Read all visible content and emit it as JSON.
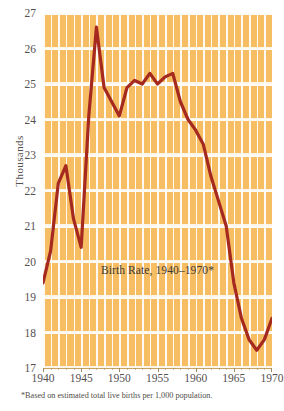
{
  "chart_data": {
    "type": "line",
    "title": "Birth Rate, 1940–1970*",
    "xlabel": "",
    "ylabel": "Thousands",
    "footnote": "*Based on estimated total live births per 1,000 population.",
    "xlim": [
      1940,
      1970
    ],
    "ylim": [
      17,
      27
    ],
    "grid": true,
    "legend": null,
    "x_ticks": [
      "1940",
      "1945",
      "1950",
      "1955",
      "1960",
      "1965",
      "1970"
    ],
    "y_ticks": [
      "17",
      "18",
      "19",
      "20",
      "21",
      "22",
      "23",
      "24",
      "25",
      "26",
      "27"
    ],
    "x": [
      1940,
      1941,
      1942,
      1943,
      1944,
      1945,
      1946,
      1947,
      1948,
      1949,
      1950,
      1951,
      1952,
      1953,
      1954,
      1955,
      1956,
      1957,
      1958,
      1959,
      1960,
      1961,
      1962,
      1963,
      1964,
      1965,
      1966,
      1967,
      1968,
      1969,
      1970
    ],
    "values": [
      19.4,
      20.3,
      22.2,
      22.7,
      21.2,
      20.4,
      24.1,
      26.6,
      24.9,
      24.5,
      24.1,
      24.9,
      25.1,
      25.0,
      25.3,
      25.0,
      25.2,
      25.3,
      24.5,
      24.0,
      23.7,
      23.3,
      22.4,
      21.7,
      21.0,
      19.4,
      18.4,
      17.8,
      17.5,
      17.8,
      18.4
    ],
    "series_name": "Birth Rate",
    "colors": {
      "line": "#a5291e",
      "plot_background": "#f5b855",
      "gridline": "#ffffff",
      "text": "#555050",
      "page_background": "#ffffff"
    }
  }
}
